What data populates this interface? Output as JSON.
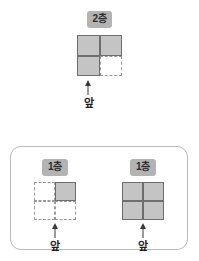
{
  "diagrams": {
    "top": {
      "floor_label": "2층",
      "front_label": "앞",
      "cells": [
        "filled",
        "filled",
        "filled",
        "empty"
      ]
    },
    "bottom_left": {
      "floor_label": "1층",
      "front_label": "앞",
      "cells": [
        "empty",
        "filled",
        "empty",
        "empty"
      ]
    },
    "bottom_right": {
      "floor_label": "1층",
      "front_label": "앞",
      "cells": [
        "filled",
        "filled",
        "filled",
        "filled"
      ]
    }
  },
  "colors": {
    "cell_fill": "#c4c4c4",
    "cell_border": "#6e6e6e",
    "dashed_border": "#9a9a9a",
    "label_bg": "#b3b3b3",
    "panel_border": "#b9b9b9",
    "arrow": "#3a3a3a"
  }
}
